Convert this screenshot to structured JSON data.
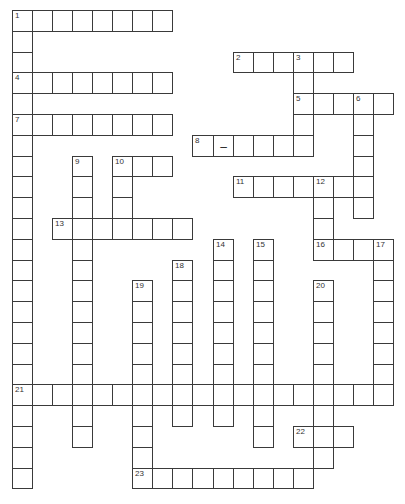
{
  "puzzle": {
    "grid": {
      "origin_x": 12,
      "origin_y": 10,
      "col_pitch": 20.05,
      "row_pitch": 20.8,
      "cols": 19,
      "rows": 23
    },
    "line_color": "#3a3a3a",
    "words": [
      {
        "num": "1",
        "dir": "across",
        "col": 0,
        "row": 0,
        "len": 8
      },
      {
        "num": "1",
        "dir": "down",
        "col": 0,
        "row": 0,
        "len": 23
      },
      {
        "num": "2",
        "dir": "across",
        "col": 11,
        "row": 2,
        "len": 6
      },
      {
        "num": "3",
        "dir": "down",
        "col": 14,
        "row": 2,
        "len": 5
      },
      {
        "num": "4",
        "dir": "across",
        "col": 0,
        "row": 3,
        "len": 8
      },
      {
        "num": "5",
        "dir": "across",
        "col": 14,
        "row": 4,
        "len": 5
      },
      {
        "num": "6",
        "dir": "down",
        "col": 17,
        "row": 4,
        "len": 6
      },
      {
        "num": "7",
        "dir": "across",
        "col": 0,
        "row": 5,
        "len": 8
      },
      {
        "num": "8",
        "dir": "across",
        "col": 9,
        "row": 6,
        "len": 6
      },
      {
        "num": "9",
        "dir": "down",
        "col": 3,
        "row": 7,
        "len": 14
      },
      {
        "num": "10",
        "dir": "across",
        "col": 5,
        "row": 7,
        "len": 3
      },
      {
        "num": "10",
        "dir": "down",
        "col": 5,
        "row": 7,
        "len": 4
      },
      {
        "num": "11",
        "dir": "across",
        "col": 11,
        "row": 8,
        "len": 7
      },
      {
        "num": "12",
        "dir": "down",
        "col": 15,
        "row": 8,
        "len": 4
      },
      {
        "num": "13",
        "dir": "across",
        "col": 2,
        "row": 10,
        "len": 7
      },
      {
        "num": "14",
        "dir": "down",
        "col": 10,
        "row": 11,
        "len": 9
      },
      {
        "num": "15",
        "dir": "down",
        "col": 12,
        "row": 11,
        "len": 10
      },
      {
        "num": "16",
        "dir": "across",
        "col": 15,
        "row": 11,
        "len": 4
      },
      {
        "num": "17",
        "dir": "down",
        "col": 18,
        "row": 11,
        "len": 8
      },
      {
        "num": "18",
        "dir": "down",
        "col": 8,
        "row": 12,
        "len": 8
      },
      {
        "num": "19",
        "dir": "down",
        "col": 6,
        "row": 13,
        "len": 10
      },
      {
        "num": "20",
        "dir": "down",
        "col": 15,
        "row": 13,
        "len": 9
      },
      {
        "num": "21",
        "dir": "across",
        "col": 0,
        "row": 18,
        "len": 19
      },
      {
        "num": "22",
        "dir": "across",
        "col": 14,
        "row": 20,
        "len": 3
      },
      {
        "num": "23",
        "dir": "across",
        "col": 6,
        "row": 22,
        "len": 9
      }
    ],
    "prefilled": [
      {
        "col": 10,
        "row": 6,
        "char": "–"
      }
    ]
  }
}
